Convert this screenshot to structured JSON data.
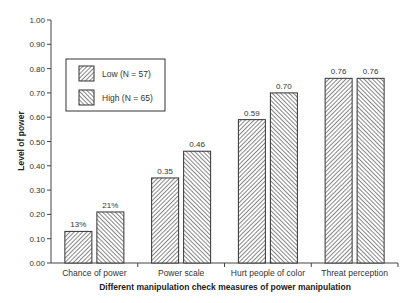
{
  "chart_data": {
    "type": "bar",
    "title": "",
    "xlabel": "Different manipulation check measures of power manipulation",
    "ylabel": "Level of power",
    "ylim": [
      0,
      1.0
    ],
    "yticks": [
      "0.00",
      "0.10",
      "0.20",
      "0.30",
      "0.40",
      "0.50",
      "0.60",
      "0.70",
      "0.80",
      "0.90",
      "1.00"
    ],
    "grid": false,
    "legend_position": "upper-left inside plot",
    "categories": [
      "Chance of power",
      "Power scale",
      "Hurt people of color",
      "Threat perception"
    ],
    "series": [
      {
        "name": "Low (N = 57)",
        "pattern": "backslash-hatch",
        "values": [
          0.13,
          0.35,
          0.59,
          0.76
        ],
        "labels": [
          "13%",
          "0.35",
          "0.59",
          "0.76"
        ]
      },
      {
        "name": "High (N = 65)",
        "pattern": "slash-hatch",
        "values": [
          0.21,
          0.46,
          0.7,
          0.76
        ],
        "labels": [
          "21%",
          "0.46",
          "0.70",
          "0.76"
        ]
      }
    ]
  },
  "colors": {
    "axis": "#444444",
    "bar_fill": "#ffffff",
    "hatch": "#555555",
    "bar_border": "#333333"
  }
}
